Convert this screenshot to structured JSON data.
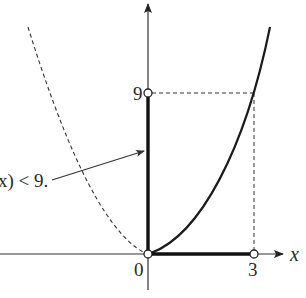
{
  "diagram": {
    "function": "y = x^2",
    "colors": {
      "ink": "#1a1a1a",
      "axis": "#333333",
      "background": "#ffffff"
    },
    "axes": {
      "x_label": "x",
      "origin_label": "0"
    },
    "ticks": {
      "x_tick_label": "3",
      "y_tick_label": "9"
    },
    "annotation": {
      "text": "x) < 9."
    },
    "points": [
      {
        "name": "origin",
        "x": 0,
        "y": 0,
        "style": "open-circle"
      },
      {
        "name": "x-three",
        "x": 3,
        "y": 0,
        "style": "open-circle"
      },
      {
        "name": "y-nine",
        "x": 0,
        "y": 9,
        "style": "open-circle"
      }
    ],
    "curves": [
      {
        "name": "parabola-right",
        "domain": "x >= 0",
        "style": "solid"
      },
      {
        "name": "parabola-left",
        "domain": "x < 0",
        "style": "dashed"
      }
    ],
    "intervals": [
      {
        "name": "domain-interval",
        "axis": "x",
        "from": 0,
        "to": 3,
        "style": "bold"
      },
      {
        "name": "range-interval",
        "axis": "y",
        "from": 0,
        "to": 9,
        "style": "bold"
      }
    ]
  }
}
